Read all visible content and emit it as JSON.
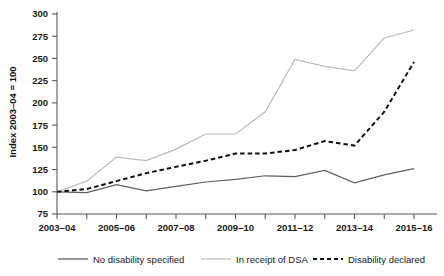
{
  "chart_data": {
    "type": "line",
    "title": "",
    "xlabel": "",
    "ylabel": "Index 2003–04 = 100",
    "x": [
      "2003–04",
      "2004–05",
      "2005–06",
      "2006–07",
      "2007–08",
      "2008–09",
      "2009–10",
      "2010–11",
      "2011–12",
      "2012–13",
      "2013–14",
      "2014–15",
      "2015–16"
    ],
    "x_tick_labels": [
      "2003–04",
      "2005–06",
      "2007–08",
      "2009–10",
      "2011–12",
      "2013–14",
      "2015–16"
    ],
    "y_tick_labels": [
      "75",
      "100",
      "125",
      "150",
      "175",
      "200",
      "225",
      "250",
      "275",
      "300"
    ],
    "ylim": [
      75,
      300
    ],
    "grid": false,
    "legend_position": "bottom",
    "series": [
      {
        "name": "No disability specified",
        "color": "#5a6066",
        "style": "solid",
        "values": [
          100,
          99,
          108,
          101,
          106,
          111,
          114,
          118,
          117,
          124,
          110,
          119,
          126
        ]
      },
      {
        "name": "In receipt of DSA",
        "color": "#b9bcbe",
        "style": "solid",
        "values": [
          100,
          112,
          139,
          135,
          148,
          165,
          165,
          190,
          249,
          241,
          236,
          273,
          282
        ]
      },
      {
        "name": "Disability declared",
        "color": "#101010",
        "style": "dashed",
        "values": [
          100,
          103,
          112,
          121,
          128,
          135,
          143,
          143,
          147,
          157,
          152,
          190,
          246
        ]
      }
    ]
  },
  "legend": {
    "items": [
      {
        "label": "No disability specified",
        "color": "#5a6066",
        "style": "solid"
      },
      {
        "label": "In receipt of DSA",
        "color": "#b9bcbe",
        "style": "solid"
      },
      {
        "label": "Disability declared",
        "color": "#101010",
        "style": "dashed"
      }
    ]
  }
}
